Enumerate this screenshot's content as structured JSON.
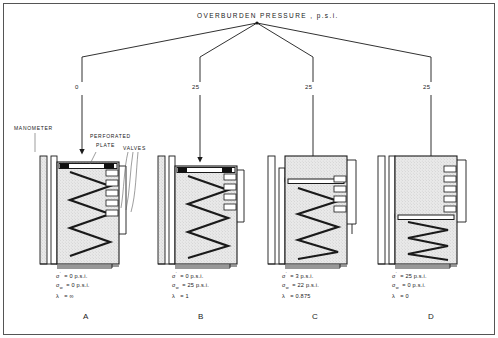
{
  "figure": {
    "title": "OVERBURDEN   PRESSURE ,  p.s.i.",
    "frame_color": "#4d4d4d",
    "ink_color": "#1a1a1a",
    "soil_fill": "#e8e8e8"
  },
  "annotations": {
    "manometer": "MANOMETER",
    "perforated_plate_line1": "PERFORATED",
    "perforated_plate_line2": "PLATE",
    "valves": "VALVES"
  },
  "branches": [
    {
      "id": "A",
      "pressure": "0"
    },
    {
      "id": "B",
      "pressure": "25"
    },
    {
      "id": "C",
      "pressure": "25"
    },
    {
      "id": "D",
      "pressure": "25"
    }
  ],
  "cases": [
    {
      "letter": "A",
      "sigma_eff_sym": "σ",
      "sigma_eff_prime": "'",
      "sigma_eff_eq": "=",
      "sigma_eff_val": "0 p.s.i.",
      "sigma_w_sym": "σ",
      "sigma_w_sub": "w",
      "sigma_w_eq": "=",
      "sigma_w_val": "0 p.s.i.",
      "lambda_sym": "λ",
      "lambda_eq": "=",
      "lambda_val": "∞"
    },
    {
      "letter": "B",
      "sigma_eff_sym": "σ",
      "sigma_eff_prime": "'",
      "sigma_eff_eq": "=",
      "sigma_eff_val": "0 p.s.i.",
      "sigma_w_sym": "σ",
      "sigma_w_sub": "w",
      "sigma_w_eq": "=",
      "sigma_w_val": "25 p.s.i.",
      "lambda_sym": "λ",
      "lambda_eq": "=",
      "lambda_val": "1"
    },
    {
      "letter": "C",
      "sigma_eff_sym": "σ",
      "sigma_eff_prime": "'",
      "sigma_eff_eq": "=",
      "sigma_eff_val": "3 p.s.i.",
      "sigma_w_sym": "σ",
      "sigma_w_sub": "w",
      "sigma_w_eq": "=",
      "sigma_w_val": "22 p.s.i.",
      "lambda_sym": "λ",
      "lambda_eq": "=",
      "lambda_val": "0.875"
    },
    {
      "letter": "D",
      "sigma_eff_sym": "σ",
      "sigma_eff_prime": "'",
      "sigma_eff_eq": "=",
      "sigma_eff_val": "25 p.s.i.",
      "sigma_w_sym": "σ",
      "sigma_w_sub": "w",
      "sigma_w_eq": "=",
      "sigma_w_val": "0 p.s.i.",
      "lambda_sym": "λ",
      "lambda_eq": "=",
      "lambda_val": "0"
    }
  ]
}
